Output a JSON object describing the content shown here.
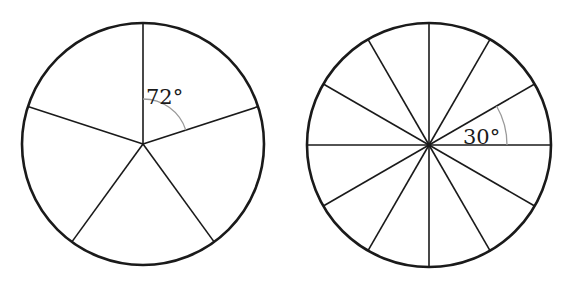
{
  "diagrams": [
    {
      "name": "five-sector-circle",
      "sectors": 5,
      "angle_label": "72°",
      "center": [
        143,
        144
      ],
      "radius": 121,
      "start_angle_deg": -90,
      "step_deg": 72,
      "marked_arc": {
        "from_deg": -90,
        "to_deg": -18,
        "radius": 45
      },
      "label_pos": [
        146,
        104
      ]
    },
    {
      "name": "twelve-sector-circle",
      "sectors": 12,
      "angle_label": "30°",
      "center": [
        429,
        145
      ],
      "radius": 122,
      "start_angle_deg": 0,
      "step_deg": 30,
      "marked_arc": {
        "from_deg": -30,
        "to_deg": 0,
        "radius": 78
      },
      "label_pos": [
        463,
        144
      ]
    }
  ],
  "colors": {
    "line": "#1a1a1a",
    "arc": "#9a9a9a",
    "background": "#ffffff"
  }
}
